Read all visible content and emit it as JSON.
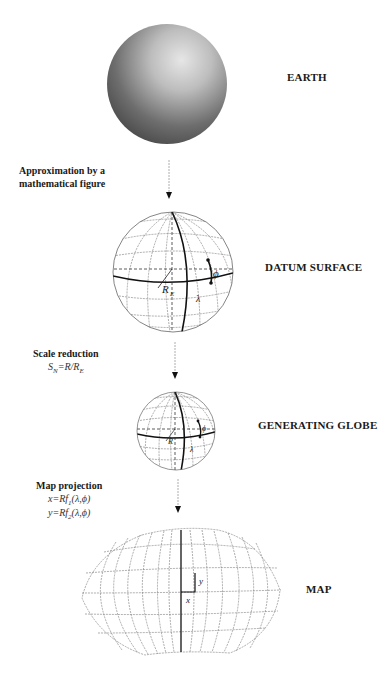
{
  "stages": [
    {
      "id": "earth",
      "label": "EARTH"
    },
    {
      "id": "datum",
      "label": "DATUM SURFACE"
    },
    {
      "id": "globe",
      "label": "GENERATING GLOBE"
    },
    {
      "id": "map",
      "label": "MAP"
    }
  ],
  "transitions": [
    {
      "title_line1": "Approximation by a",
      "title_line2": "mathematical figure"
    },
    {
      "title": "Scale reduction",
      "formula": "S_N=R/R_E",
      "formula_main": "S",
      "formula_sub": "N",
      "formula_rest": "=R/R",
      "formula_sub2": "E"
    },
    {
      "title": "Map projection",
      "formula1_a": "x=Rf",
      "formula1_sub": "1",
      "formula1_b": "(λ,ϕ)",
      "formula2_a": "y=Rf",
      "formula2_sub": "2",
      "formula2_b": "(λ,ϕ)"
    }
  ],
  "globe_symbols": {
    "radius_datum": "R",
    "radius_datum_sub": "E",
    "radius_globe": "R",
    "longitude": "λ",
    "latitude": "ϕ"
  },
  "map_symbols": {
    "x": "x",
    "y": "y"
  }
}
